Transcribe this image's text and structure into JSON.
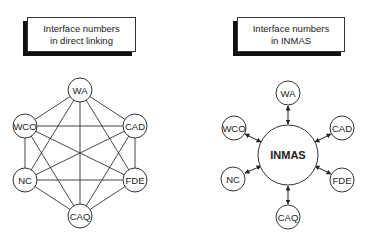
{
  "left_panel": {
    "title_line1": "Interface numbers",
    "title_line2": "in direct linking",
    "nodes": [
      {
        "label": "WA"
      },
      {
        "label": "CAD"
      },
      {
        "label": "FDE"
      },
      {
        "label": "CAQ"
      },
      {
        "label": "NC"
      },
      {
        "label": "WCO"
      }
    ],
    "connection_type": "fully connected (every node linked to every other node)"
  },
  "right_panel": {
    "title_line1": "Interface numbers",
    "title_line2": "in INMAS",
    "hub": {
      "label": "INMAS"
    },
    "nodes": [
      {
        "label": "WA"
      },
      {
        "label": "CAD"
      },
      {
        "label": "FDE"
      },
      {
        "label": "CAQ"
      },
      {
        "label": "NC"
      },
      {
        "label": "WCO"
      }
    ],
    "connection_type": "bidirectional arrows between each node and hub"
  },
  "colors": {
    "line": "#333333",
    "shadow": "#111111",
    "background": "#ffffff"
  }
}
